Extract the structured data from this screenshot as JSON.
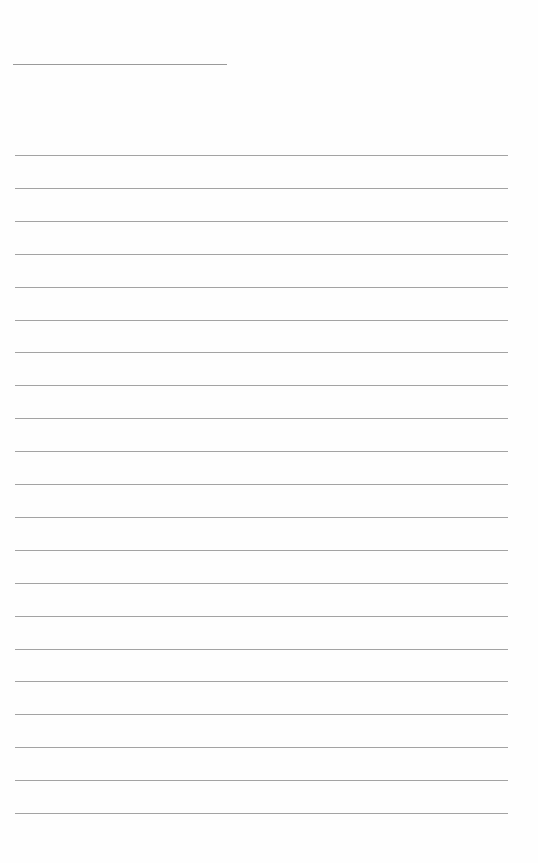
{
  "page": {
    "type": "lined-writing-paper",
    "background_color": "#fefefe",
    "line_color": "#a3a3a3",
    "header_line": {
      "x": 13,
      "y": 64,
      "width": 214
    },
    "rules": {
      "count": 21,
      "first_y": 155,
      "spacing": 32.9,
      "x": 15,
      "width": 493
    },
    "text": []
  }
}
